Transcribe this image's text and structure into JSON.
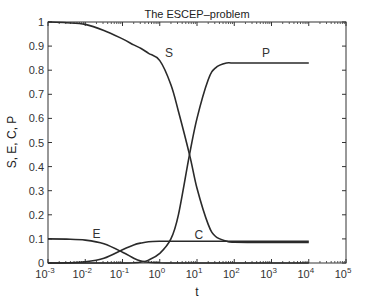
{
  "chart_data": {
    "type": "line",
    "title": "The ESCEP–problem",
    "xlabel": "t",
    "ylabel": "S, E, C, P",
    "xscale": "log",
    "xlim": [
      0.001,
      100000
    ],
    "ylim": [
      0,
      1
    ],
    "grid": false,
    "legend": "none (inline curve labels)",
    "x_ticks": [
      "10^-3",
      "10^-2",
      "10^-1",
      "10^0",
      "10^1",
      "10^2",
      "10^3",
      "10^4",
      "10^5"
    ],
    "y_ticks": [
      "0",
      "0.1",
      "0.2",
      "0.3",
      "0.4",
      "0.5",
      "0.6",
      "0.7",
      "0.8",
      "0.9",
      "1"
    ],
    "log10_t": [
      -3,
      -2.5,
      -2,
      -1.5,
      -1,
      -0.7,
      -0.5,
      -0.3,
      0,
      0.3,
      0.5,
      0.8,
      1,
      1.3,
      1.5,
      1.8,
      2,
      3,
      4
    ],
    "series": [
      {
        "name": "S",
        "values": [
          1.0,
          0.997,
          0.99,
          0.965,
          0.93,
          0.905,
          0.89,
          0.87,
          0.84,
          0.74,
          0.63,
          0.45,
          0.31,
          0.16,
          0.11,
          0.09,
          0.086,
          0.085,
          0.085
        ],
        "label_pos": [
          0.25,
          0.87
        ]
      },
      {
        "name": "E",
        "values": [
          0.1,
          0.099,
          0.095,
          0.08,
          0.045,
          0.02,
          0.008,
          0.003,
          0.001,
          0.0,
          0.0,
          0.0,
          0.0,
          0.0,
          0.0,
          0.0,
          0.0,
          0.0,
          0.0
        ],
        "label_pos": [
          -1.7,
          0.12
        ]
      },
      {
        "name": "C",
        "values": [
          0.0,
          0.001,
          0.005,
          0.02,
          0.055,
          0.075,
          0.083,
          0.088,
          0.09,
          0.09,
          0.09,
          0.09,
          0.09,
          0.09,
          0.09,
          0.09,
          0.09,
          0.09,
          0.09
        ],
        "label_pos": [
          1.05,
          0.115
        ]
      },
      {
        "name": "P",
        "values": [
          0.0,
          0.0,
          0.0,
          0.0,
          0.0,
          0.001,
          0.004,
          0.012,
          0.04,
          0.1,
          0.2,
          0.45,
          0.6,
          0.76,
          0.81,
          0.83,
          0.83,
          0.83,
          0.83
        ],
        "label_pos": [
          2.85,
          0.87
        ]
      }
    ]
  }
}
